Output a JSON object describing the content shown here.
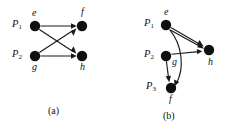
{
  "figure": {
    "background_color": "#ffffff",
    "ink_color": "#111111",
    "panels": [
      {
        "id": "panel-a",
        "caption": "(a)",
        "caption_pos": {
          "x": 48,
          "y": 107
        },
        "nodes": [
          {
            "id": "e",
            "label": "e",
            "x": 35,
            "y": 26,
            "r": 5.2,
            "label_pos": {
              "x": 32,
              "y": 11
            }
          },
          {
            "id": "f",
            "label": "f",
            "x": 82,
            "y": 26,
            "r": 5.2,
            "label_pos": {
              "x": 80,
              "y": 10
            }
          },
          {
            "id": "g",
            "label": "g",
            "x": 35,
            "y": 56,
            "r": 5.2,
            "label_pos": {
              "x": 32,
              "y": 64
            }
          },
          {
            "id": "h",
            "label": "h",
            "x": 82,
            "y": 56,
            "r": 5.2,
            "label_pos": {
              "x": 80,
              "y": 64
            }
          }
        ],
        "process_labels": [
          {
            "id": "P1",
            "text": "P",
            "sub": "1",
            "x": 13,
            "y": 21
          },
          {
            "id": "P2",
            "text": "P",
            "sub": "2",
            "x": 13,
            "y": 51
          }
        ],
        "edges": [
          {
            "id": "e-f",
            "from": "e",
            "to": "f",
            "kind": "straight",
            "directed": true
          },
          {
            "id": "e-h",
            "from": "e",
            "to": "h",
            "kind": "straight",
            "directed": true
          },
          {
            "id": "g-f",
            "from": "g",
            "to": "f",
            "kind": "straight",
            "directed": true
          },
          {
            "id": "g-h",
            "from": "g",
            "to": "h",
            "kind": "straight",
            "directed": true
          }
        ]
      },
      {
        "id": "panel-b",
        "caption": "(b)",
        "caption_pos": {
          "x": 163,
          "y": 112
        },
        "nodes": [
          {
            "id": "e",
            "label": "e",
            "x": 166,
            "y": 25,
            "r": 5.2,
            "label_pos": {
              "x": 163,
              "y": 10
            }
          },
          {
            "id": "g",
            "label": "g",
            "x": 166,
            "y": 56,
            "r": 5.2,
            "label_pos": {
              "x": 173,
              "y": 60
            }
          },
          {
            "id": "f",
            "label": "f",
            "x": 171,
            "y": 88,
            "r": 5.2,
            "label_pos": {
              "x": 169,
              "y": 96
            }
          },
          {
            "id": "h",
            "label": "h",
            "x": 209,
            "y": 50,
            "r": 5.2,
            "label_pos": {
              "x": 208,
              "y": 60
            }
          }
        ],
        "process_labels": [
          {
            "id": "P1",
            "text": "P",
            "sub": "1",
            "x": 145,
            "y": 20
          },
          {
            "id": "P2",
            "text": "P",
            "sub": "2",
            "x": 145,
            "y": 51
          },
          {
            "id": "P3",
            "text": "P",
            "sub": "3",
            "x": 147,
            "y": 83
          }
        ],
        "edges": [
          {
            "id": "e-h",
            "from": "e",
            "to": "h",
            "kind": "straight",
            "directed": true
          },
          {
            "id": "e-h2",
            "from": "e",
            "to": "h",
            "kind": "straight2",
            "directed": true
          },
          {
            "id": "e-f",
            "from": "e",
            "to": "f",
            "kind": "curve",
            "directed": true
          },
          {
            "id": "g-h",
            "from": "g",
            "to": "h",
            "kind": "straight",
            "directed": true
          },
          {
            "id": "g-f",
            "from": "g",
            "to": "f",
            "kind": "straight",
            "directed": true
          }
        ]
      }
    ]
  }
}
